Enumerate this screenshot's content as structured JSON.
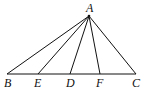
{
  "diagram": {
    "type": "geometry-triangle",
    "points": {
      "A": {
        "label": "A",
        "x": 89,
        "y": 16
      },
      "B": {
        "label": "B",
        "x": 7,
        "y": 74
      },
      "E": {
        "label": "E",
        "x": 38,
        "y": 74
      },
      "D": {
        "label": "D",
        "x": 70,
        "y": 74
      },
      "F": {
        "label": "F",
        "x": 100,
        "y": 74
      },
      "C": {
        "label": "C",
        "x": 136,
        "y": 74
      }
    },
    "segments": [
      "AB",
      "AE",
      "AD",
      "AF",
      "AC",
      "BC"
    ],
    "line_color": "#111111"
  }
}
